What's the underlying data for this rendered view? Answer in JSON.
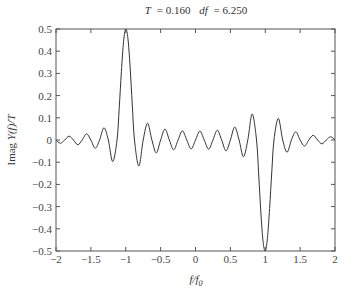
{
  "chart_data": {
    "type": "line",
    "title": "T = 0.160  df = 6.250",
    "title_parts": {
      "T_label": "T",
      "T_value": "= 0.160",
      "df_label": "df",
      "df_value": "= 6.250"
    },
    "xlabel": "f/f0",
    "ylabel": "Imag Y(f)/T",
    "xlim": [
      -2,
      2
    ],
    "ylim": [
      -0.5,
      0.5
    ],
    "xticks": [
      -2,
      -1.5,
      -1,
      -0.5,
      0,
      0.5,
      1,
      1.5,
      2
    ],
    "xtick_labels": [
      "−2",
      "−1.5",
      "−1",
      "−0.5",
      "0",
      "0.5",
      "1",
      "1.5",
      "2"
    ],
    "yticks": [
      0.5,
      0.4,
      0.3,
      0.2,
      0.1,
      0,
      -0.1,
      -0.2,
      -0.3,
      -0.4,
      -0.5
    ],
    "ytick_labels": [
      "0.5",
      "0.4",
      "0.3",
      "0.2",
      "0.1",
      "0",
      "−0.1",
      "−0.2",
      "−0.3",
      "−0.4",
      "−0.5"
    ],
    "grid": false,
    "legend": null,
    "line_color": "#333333",
    "series": [
      {
        "name": "Imag Y(f)/T",
        "x": [
          -2,
          -1.9375,
          -1.875,
          -1.8125,
          -1.75,
          -1.6875,
          -1.625,
          -1.5625,
          -1.5,
          -1.4375,
          -1.375,
          -1.3125,
          -1.25,
          -1.1875,
          -1.125,
          -1.09375,
          -1.0625,
          -1.03125,
          -1,
          -0.96875,
          -0.9375,
          -0.90625,
          -0.875,
          -0.8125,
          -0.75,
          -0.6875,
          -0.625,
          -0.5625,
          -0.5,
          -0.4375,
          -0.375,
          -0.3125,
          -0.25,
          -0.1875,
          -0.125,
          -0.0625,
          0,
          0.0625,
          0.125,
          0.1875,
          0.25,
          0.3125,
          0.375,
          0.4375,
          0.5,
          0.5625,
          0.625,
          0.6875,
          0.75,
          0.8125,
          0.875,
          0.90625,
          0.9375,
          0.96875,
          1,
          1.03125,
          1.0625,
          1.09375,
          1.125,
          1.1875,
          1.25,
          1.3125,
          1.375,
          1.4375,
          1.5,
          1.5625,
          1.625,
          1.6875,
          1.75,
          1.8125,
          1.875,
          1.9375,
          2
        ],
        "y": [
          0,
          -0.0145,
          0,
          0.0174,
          0,
          -0.0215,
          0,
          0.0276,
          0,
          -0.0373,
          0,
          0.0551,
          0,
          -0.097,
          0,
          0.1433,
          0.3087,
          0.4432,
          0.5,
          0.4573,
          0.3286,
          0.1574,
          0,
          -0.1171,
          0,
          0.0755,
          0,
          -0.0582,
          0,
          0.0492,
          0,
          -0.0441,
          0,
          0.0412,
          0,
          -0.04,
          0,
          0.04,
          0,
          -0.0412,
          0,
          0.0441,
          0,
          -0.0492,
          0,
          0.0582,
          0,
          -0.0755,
          0,
          0.1171,
          0,
          -0.1574,
          -0.3286,
          -0.4573,
          -0.5,
          -0.4432,
          -0.3087,
          -0.1433,
          0,
          0.097,
          0,
          -0.0551,
          0,
          0.0373,
          0,
          -0.0276,
          0,
          0.0215,
          0,
          -0.0174,
          0,
          0.0145,
          0
        ]
      }
    ]
  }
}
